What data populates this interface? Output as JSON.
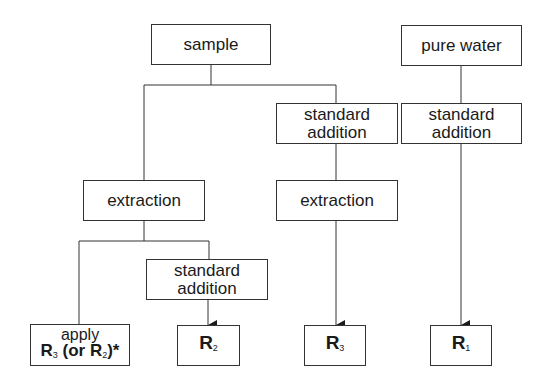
{
  "diagram": {
    "nodes": {
      "sample": "sample",
      "pure_water": "pure water",
      "std_add_mid_l1": "standard",
      "std_add_mid_l2": "addition",
      "std_add_right_l1": "standard",
      "std_add_right_l2": "addition",
      "extraction_left": "extraction",
      "extraction_mid": "extraction",
      "std_add_low_l1": "standard",
      "std_add_low_l2": "addition",
      "apply_l1": "apply",
      "apply_R": "R",
      "apply_R_sub": "3",
      "apply_or": " (or R",
      "apply_or_sub": "2",
      "apply_tail": ")*",
      "r2": "R",
      "r2_sub": "2",
      "r3": "R",
      "r3_sub": "3",
      "r1": "R",
      "r1_sub": "1"
    },
    "colors": {
      "line": "#333333",
      "background": "#ffffff"
    }
  }
}
